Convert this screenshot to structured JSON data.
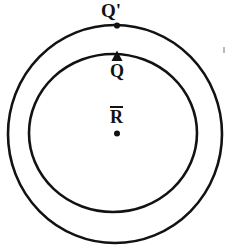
{
  "figure": {
    "background_color": "#ffffff",
    "ink_color": "#121212",
    "labels": {
      "outer_point": "Q'",
      "inner_point": "Q",
      "center_point": "R",
      "center_point_has_overbar": true
    },
    "markers": {
      "outer_point_marker": "filled-dot",
      "inner_point_marker": "filled-triangle-up",
      "center_marker": "filled-dot"
    }
  },
  "chart_data": {
    "type": "diagram",
    "shapes": [
      {
        "name": "outer-circle",
        "kind": "circle",
        "cx": 115,
        "cy": 134,
        "rx": 107,
        "ry": 109,
        "stroke": "#121212",
        "stroke_width": 2.6,
        "fill": "none"
      },
      {
        "name": "inner-circle",
        "kind": "circle",
        "cx": 113,
        "cy": 133,
        "rx": 84,
        "ry": 79,
        "stroke": "#121212",
        "stroke_width": 2.6,
        "fill": "none"
      }
    ],
    "points": [
      {
        "name": "Q-prime",
        "label": "Q'",
        "x": 117,
        "y": 25,
        "marker": "dot",
        "on": "outer-circle",
        "label_x": 112,
        "label_y": 11
      },
      {
        "name": "Q",
        "label": "Q",
        "x": 117,
        "y": 57,
        "marker": "triangle",
        "on": "inner-circle",
        "label_x": 117,
        "label_y": 71
      },
      {
        "name": "R-bar",
        "label": "R",
        "x": 117,
        "y": 133,
        "marker": "dot",
        "on": "center",
        "label_x": 117,
        "label_y": 118
      }
    ],
    "artifacts": [
      {
        "name": "scan-speck",
        "x": 224,
        "y": 50,
        "w": 1.4,
        "h": 6
      }
    ],
    "xlim": [
      0,
      237
    ],
    "ylim": [
      0,
      250
    ],
    "grid": false,
    "legend": null
  }
}
